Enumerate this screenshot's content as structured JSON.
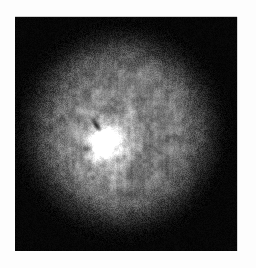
{
  "figure": {
    "kind": "astronomical-grayscale-image",
    "title": "",
    "caption": "",
    "background_color": "#ffffff",
    "panel": {
      "x": 15,
      "y": 17,
      "width": 222,
      "height": 234,
      "background_color": "#000000",
      "border_color": "#d0d0d0"
    }
  },
  "chart_data": {
    "type": "heatmap",
    "title": "",
    "subtitle": "",
    "xlabel": "",
    "ylabel": "",
    "colormap": "grayscale",
    "grid": false,
    "legend": "none",
    "axis_ticks_visible": false,
    "xlim": [
      0,
      222
    ],
    "ylim": [
      0,
      234
    ],
    "value_range": [
      0,
      255
    ],
    "features": [
      {
        "name": "diffuse-halo",
        "kind": "extended-emission",
        "center_x": 106,
        "center_y": 114,
        "radius_x": 98,
        "radius_y": 100,
        "peak_value": 150,
        "falloff": "gaussian-shell",
        "texture": "speckled-mottled"
      },
      {
        "name": "bright-core",
        "kind": "compact-source",
        "center_x": 90,
        "center_y": 128,
        "radius_x": 9,
        "radius_y": 14,
        "rotation_deg": -22,
        "peak_value": 255,
        "falloff": "gaussian"
      },
      {
        "name": "inner-bright-envelope",
        "kind": "extended-emission",
        "center_x": 90,
        "center_y": 128,
        "radius_x": 26,
        "radius_y": 32,
        "peak_value": 185,
        "falloff": "gaussian"
      },
      {
        "name": "dark-streak",
        "kind": "absorption-feature",
        "center_x": 81,
        "center_y": 108,
        "length": 16,
        "width": 3,
        "rotation_deg": 55,
        "value": 20
      }
    ],
    "noise": {
      "kind": "poisson-speckle",
      "amplitude": 0.42,
      "horizontal_streak_bias": 0.35,
      "grain_px": 2
    }
  }
}
